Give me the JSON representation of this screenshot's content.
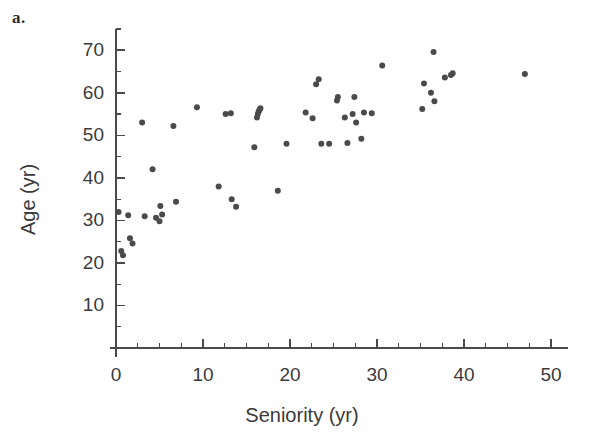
{
  "figure": {
    "panel_label": "a.",
    "background_color": "#ffffff"
  },
  "chart_data": {
    "type": "scatter",
    "title": "",
    "panel": "a.",
    "xlabel": "Seniority (yr)",
    "ylabel": "Age (yr)",
    "xlim": [
      0,
      52
    ],
    "ylim": [
      0,
      75
    ],
    "xticks": [
      0,
      10,
      20,
      30,
      40,
      50
    ],
    "yticks": [
      10,
      20,
      30,
      40,
      50,
      60,
      70
    ],
    "xtick_labels": [
      "0",
      "10",
      "20",
      "30",
      "40",
      "50"
    ],
    "ytick_labels": [
      "10",
      "20",
      "30",
      "40",
      "50",
      "60",
      "70"
    ],
    "x_minor_tick_interval": 2.5,
    "y_minor_tick_interval": 5,
    "grid": false,
    "legend": null,
    "marker_color": "#4a4a4a",
    "marker_size": 6,
    "marker_shape": "circle",
    "n_points": 56,
    "series": [
      {
        "name": "employees",
        "points": [
          [
            0.3,
            32.0
          ],
          [
            0.6,
            22.8
          ],
          [
            0.8,
            21.8
          ],
          [
            1.4,
            31.2
          ],
          [
            1.6,
            25.8
          ],
          [
            1.9,
            24.6
          ],
          [
            3.0,
            53.0
          ],
          [
            3.3,
            31.0
          ],
          [
            4.2,
            42.0
          ],
          [
            4.6,
            30.6
          ],
          [
            5.0,
            29.8
          ],
          [
            5.1,
            33.4
          ],
          [
            5.3,
            31.4
          ],
          [
            6.6,
            52.2
          ],
          [
            6.9,
            34.4
          ],
          [
            9.3,
            56.6
          ],
          [
            11.8,
            38.0
          ],
          [
            12.6,
            55.0
          ],
          [
            13.2,
            55.2
          ],
          [
            13.3,
            35.0
          ],
          [
            13.8,
            33.2
          ],
          [
            15.9,
            47.2
          ],
          [
            16.2,
            54.2
          ],
          [
            16.3,
            55.0
          ],
          [
            16.4,
            55.6
          ],
          [
            16.5,
            56.0
          ],
          [
            16.6,
            56.4
          ],
          [
            18.6,
            37.0
          ],
          [
            19.6,
            48.0
          ],
          [
            21.8,
            55.4
          ],
          [
            22.6,
            54.0
          ],
          [
            23.0,
            62.0
          ],
          [
            23.3,
            63.2
          ],
          [
            23.6,
            48.0
          ],
          [
            24.5,
            48.0
          ],
          [
            25.4,
            58.2
          ],
          [
            25.5,
            59.0
          ],
          [
            26.3,
            54.2
          ],
          [
            26.6,
            48.2
          ],
          [
            27.2,
            55.0
          ],
          [
            27.4,
            59.0
          ],
          [
            27.6,
            53.0
          ],
          [
            28.2,
            49.2
          ],
          [
            28.5,
            55.4
          ],
          [
            29.4,
            55.2
          ],
          [
            30.6,
            66.4
          ],
          [
            35.2,
            56.2
          ],
          [
            35.4,
            62.2
          ],
          [
            36.2,
            60.0
          ],
          [
            36.5,
            69.6
          ],
          [
            36.6,
            58.0
          ],
          [
            37.8,
            63.6
          ],
          [
            38.5,
            64.2
          ],
          [
            38.7,
            64.6
          ],
          [
            47.0,
            64.4
          ]
        ]
      }
    ]
  }
}
